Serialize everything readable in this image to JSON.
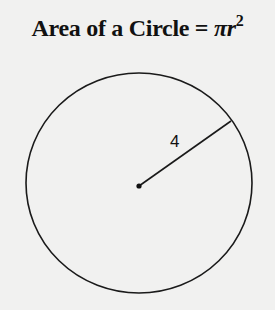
{
  "title": {
    "prefix": "Area of a Circle = ",
    "pi": "π",
    "r": "r",
    "exponent": "2"
  },
  "diagram": {
    "radius_label": "4",
    "colors": {
      "background": "#f1f1f0",
      "stroke": "#1a1a1a"
    }
  }
}
